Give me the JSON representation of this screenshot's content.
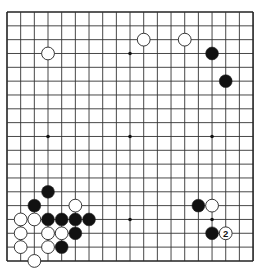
{
  "board": {
    "size": 19,
    "origin_x": 7,
    "origin_y": 12,
    "spacing_x": 13.67,
    "spacing_y": 13.83,
    "stone_radius": 6.4,
    "line_color": "#333333",
    "border_color": "#222222",
    "black_color": "#111111",
    "white_color": "#ffffff",
    "hoshi": [
      [
        3,
        3
      ],
      [
        9,
        3
      ],
      [
        15,
        3
      ],
      [
        3,
        9
      ],
      [
        9,
        9
      ],
      [
        15,
        9
      ],
      [
        3,
        15
      ],
      [
        9,
        15
      ],
      [
        15,
        15
      ]
    ],
    "stones": [
      {
        "color": "white",
        "col": 3,
        "row": 3
      },
      {
        "color": "white",
        "col": 10,
        "row": 2
      },
      {
        "color": "white",
        "col": 13,
        "row": 2
      },
      {
        "color": "black",
        "col": 15,
        "row": 3
      },
      {
        "color": "black",
        "col": 16,
        "row": 5
      },
      {
        "color": "black",
        "col": 3,
        "row": 13
      },
      {
        "color": "black",
        "col": 2,
        "row": 14
      },
      {
        "color": "white",
        "col": 5,
        "row": 14
      },
      {
        "color": "white",
        "col": 1,
        "row": 15
      },
      {
        "color": "white",
        "col": 2,
        "row": 15
      },
      {
        "color": "black",
        "col": 3,
        "row": 15
      },
      {
        "color": "black",
        "col": 4,
        "row": 15
      },
      {
        "color": "black",
        "col": 5,
        "row": 15
      },
      {
        "color": "black",
        "col": 6,
        "row": 15
      },
      {
        "color": "white",
        "col": 1,
        "row": 16
      },
      {
        "color": "white",
        "col": 3,
        "row": 16
      },
      {
        "color": "white",
        "col": 4,
        "row": 16
      },
      {
        "color": "black",
        "col": 5,
        "row": 16
      },
      {
        "color": "white",
        "col": 1,
        "row": 17
      },
      {
        "color": "white",
        "col": 3,
        "row": 17
      },
      {
        "color": "black",
        "col": 4,
        "row": 17
      },
      {
        "color": "white",
        "col": 2,
        "row": 18
      },
      {
        "color": "black",
        "col": 14,
        "row": 14
      },
      {
        "color": "white",
        "col": 15,
        "row": 14
      },
      {
        "color": "black",
        "col": 15,
        "row": 16
      },
      {
        "color": "white",
        "col": 16,
        "row": 16,
        "label": "2"
      }
    ]
  }
}
